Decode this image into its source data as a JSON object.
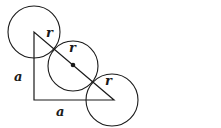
{
  "diagram": {
    "labels": {
      "leg_vertical": "a",
      "leg_horizontal": "a",
      "radius_top": "r",
      "radius_middle": "r",
      "radius_bottom": "r"
    },
    "colors": {
      "stroke": "#1a1a1a",
      "background": "#ffffff"
    }
  }
}
